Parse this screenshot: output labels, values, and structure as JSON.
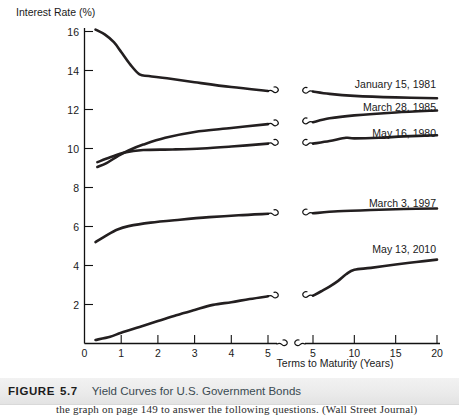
{
  "figure": {
    "label": "FIGURE",
    "number": "5.7",
    "title": "Yield Curves for U.S. Government Bonds",
    "trailing_body_text": "the graph on page 149 to answer the following questions. (Wall Street Journal)"
  },
  "chart_data": {
    "type": "line",
    "title": "Yield Curves for U.S. Government Bonds",
    "xlabel": "Terms to Maturity (Years)",
    "ylabel": "Interest Rate (%)",
    "ylim": [
      0,
      16
    ],
    "yticks": [
      2,
      4,
      6,
      8,
      10,
      12,
      14,
      16
    ],
    "ytick_labels": [
      "2",
      "4",
      "6",
      "8",
      "10",
      "12",
      "14",
      "16"
    ],
    "grid": false,
    "legend_position": "inline-right-of-curve",
    "axis_break": {
      "present": true,
      "left_segment_xlim": [
        0,
        5
      ],
      "right_segment_xlim": [
        5,
        20
      ],
      "note": "x-axis is broken between the 0-5 year detail segment and the 5-20 year segment"
    },
    "xticks_left": [
      0,
      1,
      2,
      3,
      4,
      5
    ],
    "xtick_labels_left": [
      "0",
      "1",
      "2",
      "3",
      "4",
      "5"
    ],
    "xticks_right": [
      5,
      10,
      15,
      20
    ],
    "xtick_labels_right": [
      "5",
      "10",
      "15",
      "20"
    ],
    "series": [
      {
        "name": "January 15, 1981",
        "label": "January 15, 1981",
        "shape": "inverted (downward-sloping)",
        "left_points": [
          [
            0.3,
            16.1
          ],
          [
            0.55,
            15.85
          ],
          [
            0.8,
            15.45
          ],
          [
            1.0,
            14.95
          ],
          [
            1.25,
            14.3
          ],
          [
            1.5,
            13.8
          ],
          [
            1.75,
            13.72
          ],
          [
            2.25,
            13.6
          ],
          [
            3.0,
            13.4
          ],
          [
            4.0,
            13.15
          ],
          [
            5.0,
            12.95
          ]
        ],
        "right_points": [
          [
            5.0,
            12.92
          ],
          [
            7.0,
            12.8
          ],
          [
            10.0,
            12.7
          ],
          [
            15.0,
            12.62
          ],
          [
            20.0,
            12.58
          ]
        ]
      },
      {
        "name": "March 28, 1985",
        "label": "March 28, 1985",
        "shape": "upward-sloping (steep then flattening)",
        "left_points": [
          [
            0.35,
            9.05
          ],
          [
            0.6,
            9.25
          ],
          [
            0.9,
            9.6
          ],
          [
            1.2,
            9.9
          ],
          [
            1.6,
            10.2
          ],
          [
            2.2,
            10.55
          ],
          [
            3.0,
            10.85
          ],
          [
            4.0,
            11.05
          ],
          [
            5.0,
            11.25
          ]
        ],
        "right_points": [
          [
            5.0,
            11.35
          ],
          [
            7.0,
            11.55
          ],
          [
            10.0,
            11.7
          ],
          [
            15.0,
            11.85
          ],
          [
            20.0,
            11.95
          ]
        ]
      },
      {
        "name": "May 16, 1980",
        "label": "May 16, 1980",
        "shape": "flat / slightly humped",
        "left_points": [
          [
            0.35,
            9.3
          ],
          [
            0.7,
            9.55
          ],
          [
            1.1,
            9.8
          ],
          [
            1.6,
            9.92
          ],
          [
            2.4,
            9.95
          ],
          [
            3.2,
            10.0
          ],
          [
            4.0,
            10.1
          ],
          [
            5.0,
            10.25
          ]
        ],
        "right_points": [
          [
            5.0,
            10.25
          ],
          [
            7.0,
            10.38
          ],
          [
            9.0,
            10.55
          ],
          [
            10.0,
            10.52
          ],
          [
            13.0,
            10.55
          ],
          [
            16.0,
            10.62
          ],
          [
            20.0,
            10.68
          ]
        ]
      },
      {
        "name": "March 3, 1997",
        "label": "March 3, 1997",
        "shape": "upward-sloping, flattening",
        "left_points": [
          [
            0.3,
            5.2
          ],
          [
            0.6,
            5.55
          ],
          [
            0.9,
            5.85
          ],
          [
            1.2,
            6.02
          ],
          [
            1.8,
            6.2
          ],
          [
            2.6,
            6.35
          ],
          [
            3.4,
            6.48
          ],
          [
            4.2,
            6.58
          ],
          [
            5.0,
            6.65
          ]
        ],
        "right_points": [
          [
            5.0,
            6.68
          ],
          [
            8.0,
            6.78
          ],
          [
            12.0,
            6.85
          ],
          [
            16.0,
            6.9
          ],
          [
            20.0,
            6.92
          ]
        ]
      },
      {
        "name": "May 13, 2010",
        "label": "May 13, 2010",
        "shape": "steeply upward-sloping",
        "left_points": [
          [
            0.3,
            0.18
          ],
          [
            0.7,
            0.35
          ],
          [
            1.0,
            0.55
          ],
          [
            1.5,
            0.85
          ],
          [
            2.0,
            1.15
          ],
          [
            2.5,
            1.45
          ],
          [
            3.0,
            1.72
          ],
          [
            3.5,
            1.98
          ],
          [
            4.0,
            2.12
          ],
          [
            4.5,
            2.28
          ],
          [
            5.0,
            2.42
          ]
        ],
        "right_points": [
          [
            5.0,
            2.45
          ],
          [
            6.0,
            2.68
          ],
          [
            7.0,
            2.92
          ],
          [
            8.0,
            3.2
          ],
          [
            9.0,
            3.55
          ],
          [
            10.0,
            3.78
          ],
          [
            12.0,
            3.88
          ],
          [
            15.0,
            4.05
          ],
          [
            17.5,
            4.18
          ],
          [
            20.0,
            4.3
          ]
        ]
      }
    ]
  },
  "axes": {
    "y_axis_title": "Interest Rate (%)",
    "x_axis_title": "Terms to Maturity (Years)"
  }
}
